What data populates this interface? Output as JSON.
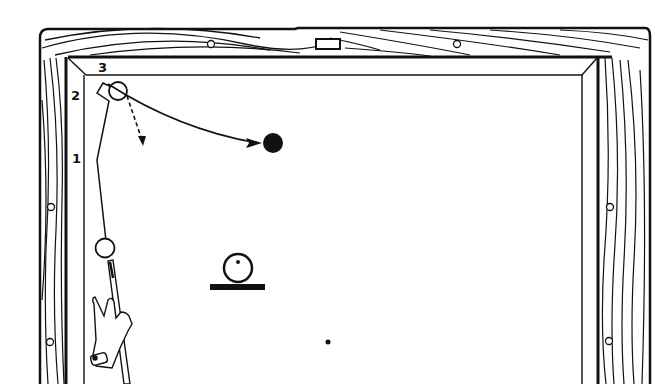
{
  "diagram": {
    "colors": {
      "ink": "#111111",
      "background": "#ffffff"
    },
    "rail_labels": [
      {
        "id": "1",
        "text": "1",
        "x": 72,
        "y": 152
      },
      {
        "id": "2",
        "text": "2",
        "x": 71,
        "y": 89
      },
      {
        "id": "3",
        "text": "3",
        "x": 98,
        "y": 61
      }
    ],
    "elements": {
      "cue_ball": "cue-ball (open circle, lower left near rail)",
      "object_ball_corner": "object-ball at corner (open circle)",
      "target_ball": "target-ball (solid black)",
      "ball_side_view": "ball-on-cloth side-view icon (circle with center dot on bar)",
      "spot": "foot/head spot (small dot)",
      "hand": "bridge hand holding cue"
    }
  }
}
